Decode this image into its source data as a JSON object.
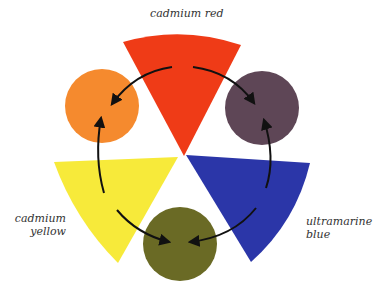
{
  "diagram": {
    "primaries": [
      {
        "name": "cadmium red",
        "color": "#ef3b17"
      },
      {
        "name": "cadmium yellow",
        "color": "#f7ea3a"
      },
      {
        "name": "ultramarine blue",
        "color": "#2b36a8"
      }
    ],
    "secondaries": [
      {
        "name": "orange",
        "color": "#f58a2e",
        "from": [
          "cadmium red",
          "cadmium yellow"
        ]
      },
      {
        "name": "purple",
        "color": "#5e4656",
        "from": [
          "cadmium red",
          "ultramarine blue"
        ]
      },
      {
        "name": "green",
        "color": "#6a6a25",
        "from": [
          "cadmium yellow",
          "ultramarine blue"
        ]
      }
    ],
    "labels": {
      "red": "cadmium red",
      "yellow_line1": "cadmium",
      "yellow_line2": "yellow",
      "blue_line1": "ultramarine",
      "blue_line2": "blue"
    },
    "arrow_color": "#111111"
  }
}
